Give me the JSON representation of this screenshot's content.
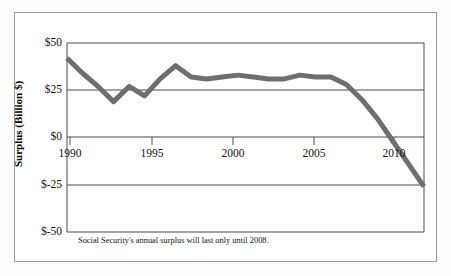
{
  "figure": {
    "caption": "Social Security's annual surplus will last only until 2008.",
    "line_color": "#6e6e6e",
    "axis_color": "#4a4a4a",
    "frame_color": "#9a9a9a"
  },
  "axes": {
    "ylabel": "Surplus (Billion $)",
    "yticks": [
      "$50",
      "$25",
      "$0",
      "$-25",
      "$-50"
    ],
    "xticks": [
      "1990",
      "1995",
      "2000",
      "2005",
      "2010"
    ]
  },
  "chart_data": {
    "type": "line",
    "title": "",
    "subtitle": "",
    "xlabel": "",
    "ylabel": "Surplus (Billion $)",
    "xlim": [
      1990,
      2013
    ],
    "ylim": [
      -50,
      50
    ],
    "ytick_values": [
      50,
      25,
      0,
      -25,
      -50
    ],
    "ytick_labels": [
      "$50",
      "$25",
      "$0",
      "$-25",
      "$-50"
    ],
    "xtick_values": [
      1990,
      1995,
      2000,
      2005,
      2010
    ],
    "xtick_labels": [
      "1990",
      "1995",
      "2000",
      "2005",
      "2010"
    ],
    "grid": "horizontal",
    "legend": "none",
    "annotation": "Social Security's annual surplus will last only until 2008.",
    "series": [
      {
        "name": "Annual surplus",
        "color": "#6e6e6e",
        "line_width": 5,
        "x": [
          1990,
          1991,
          1992,
          1993,
          1994,
          1995,
          1996,
          1997,
          1998,
          1999,
          2000,
          2001,
          2002,
          2003,
          2004,
          2005,
          2006,
          2007,
          2008,
          2009,
          2010,
          2011,
          2012,
          2013
        ],
        "values": [
          42,
          34,
          27,
          19,
          27,
          22,
          31,
          38,
          32,
          31,
          32,
          33,
          32,
          31,
          31,
          33,
          32,
          32,
          28,
          20,
          10,
          -2,
          -14,
          -26
        ]
      }
    ]
  }
}
